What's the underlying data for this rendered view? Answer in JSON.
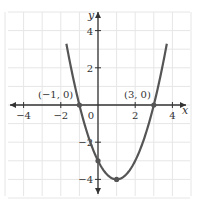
{
  "chart_data": {
    "type": "line",
    "title": "",
    "function": "y = x^2 - 2x - 3",
    "xlabel": "x",
    "ylabel": "y",
    "xlim": [
      -5,
      5
    ],
    "ylim": [
      -5,
      5
    ],
    "grid": true,
    "x_ticks": [
      -4,
      -2,
      0,
      2,
      4
    ],
    "x_tick_labels": [
      "−4",
      "−2",
      "0",
      "2",
      "4"
    ],
    "y_ticks": [
      4,
      2,
      -2,
      -4
    ],
    "y_tick_labels": [
      "4",
      "2",
      "−2",
      "−4"
    ],
    "series": [
      {
        "name": "parabola",
        "x": [
          -1.6,
          -1,
          0,
          1,
          2,
          3,
          3.6
        ],
        "values": [
          2.76,
          0,
          -3,
          -4,
          -3,
          0,
          2.76
        ]
      }
    ],
    "points": [
      {
        "x": -1,
        "y": 0,
        "label": "(−1, 0)"
      },
      {
        "x": 3,
        "y": 0,
        "label": "(3, 0)"
      },
      {
        "x": 0,
        "y": -3,
        "label": ""
      },
      {
        "x": 1,
        "y": -4,
        "label": ""
      }
    ],
    "annotations": [
      "(−1, 0)",
      "(3, 0)"
    ]
  },
  "colors": {
    "curve": "#555555",
    "axis": "#333333",
    "grid": "#e6e6e6",
    "point": "#555555"
  }
}
